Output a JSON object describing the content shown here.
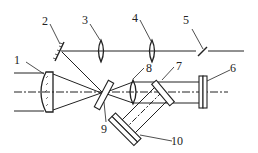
{
  "diagram": {
    "type": "optical-schematic",
    "line_color": "#222222",
    "background": "#ffffff",
    "labels": [
      {
        "id": "1",
        "text": "1"
      },
      {
        "id": "2",
        "text": "2"
      },
      {
        "id": "3",
        "text": "3"
      },
      {
        "id": "4",
        "text": "4"
      },
      {
        "id": "5",
        "text": "5"
      },
      {
        "id": "6",
        "text": "6"
      },
      {
        "id": "7",
        "text": "7"
      },
      {
        "id": "8",
        "text": "8"
      },
      {
        "id": "9",
        "text": "9"
      },
      {
        "id": "10",
        "text": "10"
      }
    ],
    "components": [
      {
        "id": "1",
        "kind": "meniscus-lens"
      },
      {
        "id": "2",
        "kind": "mirror"
      },
      {
        "id": "3",
        "kind": "convex-lens"
      },
      {
        "id": "4",
        "kind": "convex-lens"
      },
      {
        "id": "5",
        "kind": "tilted-element"
      },
      {
        "id": "6",
        "kind": "plate"
      },
      {
        "id": "7",
        "kind": "tilted-plate"
      },
      {
        "id": "8",
        "kind": "convex-lens"
      },
      {
        "id": "9",
        "kind": "tilted-beamsplitter"
      },
      {
        "id": "10",
        "kind": "tilted-plate"
      }
    ]
  }
}
